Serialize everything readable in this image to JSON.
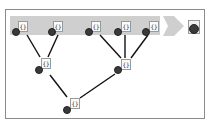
{
  "diagram": {
    "type": "tree-merge",
    "colors": {
      "band": "#cfcfcf",
      "arrow": "#cfcfcf",
      "edge": "#111111",
      "dot": "#3a3a3a",
      "frame": "#8a8a8a"
    },
    "node_glyph": "{}",
    "top_row": [
      {
        "id": "n1"
      },
      {
        "id": "n2"
      },
      {
        "id": "n3"
      },
      {
        "id": "n4"
      },
      {
        "id": "n5"
      }
    ],
    "middle_row": [
      {
        "id": "m1"
      },
      {
        "id": "m2"
      }
    ],
    "bottom_row": [
      {
        "id": "b1"
      }
    ],
    "output": {
      "id": "out"
    }
  }
}
